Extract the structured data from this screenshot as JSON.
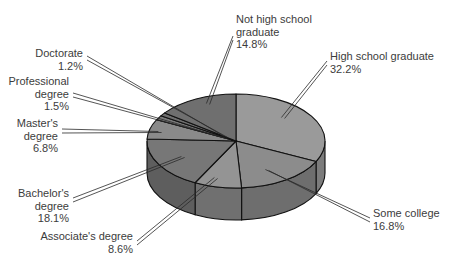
{
  "chart_data": {
    "type": "pie",
    "style": "3d",
    "title": "",
    "start_angle_deg": 0,
    "direction": "clockwise",
    "slices": [
      {
        "label": "High school graduate",
        "lines": [
          "High school graduate"
        ],
        "value": 32.2,
        "pct": "32.2%",
        "color": "#9a9a9a",
        "side": "#7c7c7c"
      },
      {
        "label": "Some college",
        "lines": [
          "Some college"
        ],
        "value": 16.8,
        "pct": "16.8%",
        "color": "#8c8c8c",
        "side": "#6e6e6e"
      },
      {
        "label": "Associate's degree",
        "lines": [
          "Associate's degree"
        ],
        "value": 8.6,
        "pct": "8.6%",
        "color": "#949494",
        "side": "#707070"
      },
      {
        "label": "Bachelor's degree",
        "lines": [
          "Bachelor's",
          "degree"
        ],
        "value": 18.1,
        "pct": "18.1%",
        "color": "#777777",
        "side": "#5e5e5e"
      },
      {
        "label": "Master's degree",
        "lines": [
          "Master's",
          "degree"
        ],
        "value": 6.8,
        "pct": "6.8%",
        "color": "#8a8a8a",
        "side": "#6a6a6a"
      },
      {
        "label": "Professional degree",
        "lines": [
          "Professional",
          "degree"
        ],
        "value": 1.5,
        "pct": "1.5%",
        "color": "#7a7a7a",
        "side": "#606060"
      },
      {
        "label": "Doctorate",
        "lines": [
          "Doctorate"
        ],
        "value": 1.2,
        "pct": "1.2%",
        "color": "#6e6e6e",
        "side": "#585858"
      },
      {
        "label": "Not high school graduate",
        "lines": [
          "Not high school",
          "graduate"
        ],
        "value": 14.8,
        "pct": "14.8%",
        "color": "#6f6f6f",
        "side": "#575757"
      }
    ],
    "geometry": {
      "cx": 236,
      "cy": 141,
      "rx": 89,
      "ry": 47,
      "depth": 32
    }
  },
  "labels": [
    {
      "key": "hs",
      "x": 330,
      "y": 50,
      "align": "left",
      "anchor": [
        327,
        63
      ],
      "point": [
        283,
        118
      ]
    },
    {
      "key": "sc",
      "x": 373,
      "y": 207,
      "align": "left",
      "anchor": [
        370,
        220
      ],
      "point": [
        267,
        170
      ]
    },
    {
      "key": "assoc",
      "x": 0,
      "y": 230,
      "align": "right",
      "anchor": [
        137,
        243
      ],
      "right": 133,
      "point": [
        216,
        178
      ]
    },
    {
      "key": "bach",
      "x": 0,
      "y": 187,
      "align": "right",
      "anchor": [
        73,
        200
      ],
      "right": 69,
      "point": [
        183,
        157
      ]
    },
    {
      "key": "mast",
      "x": 0,
      "y": 117,
      "align": "right",
      "anchor": [
        62,
        131
      ],
      "right": 58,
      "point": [
        160,
        132
      ]
    },
    {
      "key": "prof",
      "x": 0,
      "y": 75,
      "align": "right",
      "anchor": [
        73,
        95
      ],
      "right": 69,
      "point": [
        225,
        138
      ]
    },
    {
      "key": "doct",
      "x": 0,
      "y": 47,
      "align": "right",
      "anchor": [
        87,
        58
      ],
      "right": 83,
      "point": [
        226,
        137
      ]
    },
    {
      "key": "nhs",
      "x": 236,
      "y": 13,
      "align": "left",
      "anchor": [
        233,
        38
      ],
      "point": [
        208,
        104
      ]
    }
  ]
}
